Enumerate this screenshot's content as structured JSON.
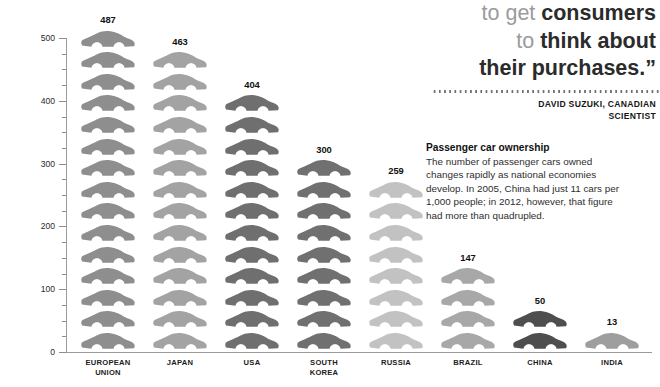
{
  "chart_data": {
    "type": "bar",
    "title": "Passenger car ownership",
    "xlabel": "",
    "ylabel": "PASSENGER CAR DENSITY PER 1,000 INHABITANTS",
    "ylim": [
      0,
      500
    ],
    "ytick_labels": [
      "0",
      "100",
      "200",
      "300",
      "400",
      "500"
    ],
    "ytick_values": [
      0,
      100,
      200,
      300,
      400,
      500
    ],
    "minor_tick_step": 25,
    "grid": false,
    "legend": "none",
    "pictogram_unit": 33,
    "pictogram_icon": "car-icon",
    "categories": [
      "EUROPEAN\nUNION",
      "JAPAN",
      "USA",
      "SOUTH KOREA",
      "RUSSIA",
      "BRAZIL",
      "CHINA",
      "INDIA"
    ],
    "values": [
      487,
      463,
      404,
      300,
      259,
      147,
      50,
      13
    ],
    "value_labels": [
      "487",
      "463",
      "404",
      "300",
      "259",
      "147",
      "50",
      "13"
    ],
    "bar_colors": [
      "#8e8e8e",
      "#a3a3a3",
      "#6f6f6f",
      "#707070",
      "#c2c2c2",
      "#a8a8a8",
      "#4e4e4e",
      "#9e9e9e"
    ],
    "car_counts": [
      15,
      14,
      12,
      9,
      8,
      4,
      2,
      1
    ]
  },
  "axis": {
    "label": "PASSENGER CAR DENSITY PER 1,000 INHABITANTS",
    "ticks": [
      "500",
      "400",
      "300",
      "200",
      "100",
      "0"
    ]
  },
  "panel": {
    "quote": {
      "line1_light": "to get ",
      "line1_bold": "consumers",
      "line2_light": "to ",
      "line2_bold": "think about",
      "line3_bold": "their purchases.”"
    },
    "attribution": "DAVID SUZUKI, CANADIAN\nSCIENTIST",
    "body_heading": "Passenger car ownership",
    "body_text": "The number of passenger cars owned changes rapidly as national economies develop. In 2005, China had just 11 cars per 1,000 people; in 2012, however, that figure had more than quadrupled."
  },
  "colors": {
    "axis": "#9a9a9a",
    "text_dark": "#1c1c1c",
    "quote_light": "#9b9b9b",
    "quote_bold": "#2b2b2b"
  }
}
